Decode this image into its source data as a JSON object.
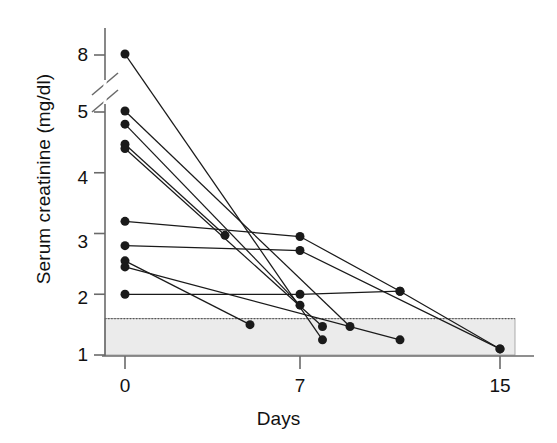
{
  "chart_data": {
    "type": "line",
    "title": "",
    "subtitle": "",
    "xlabel": "Days",
    "ylabel": "Serum creatinine (mg/dl)",
    "x_ticks": [
      0,
      7,
      15
    ],
    "x_tick_labels": [
      "0",
      "7",
      "15"
    ],
    "xlim": [
      -1,
      16
    ],
    "y_ticks": [
      1,
      2,
      3,
      4,
      5,
      8
    ],
    "y_tick_labels": [
      "1",
      "2",
      "3",
      "4",
      "5",
      "8"
    ],
    "ylim": [
      1,
      8
    ],
    "axis_break": {
      "present": true,
      "between": [
        5,
        8
      ],
      "description": "diagonal double-slash break on y-axis between 5 and 8"
    },
    "grid": false,
    "legend": null,
    "annotations": [],
    "shaded_band": {
      "label": "normal reference range",
      "y_min": 1.0,
      "y_max": 1.6,
      "fill": "#ebebeb",
      "top_border": "dotted",
      "extends_beyond_axis": true
    },
    "marker": {
      "shape": "circle",
      "color": "#1a1a1a",
      "size": 9
    },
    "line_color": "#1a1a1a",
    "series": [
      {
        "name": "Patient 1",
        "x": [
          0,
          7.9
        ],
        "y": [
          8.05,
          1.25
        ]
      },
      {
        "name": "Patient 2",
        "x": [
          0,
          9.0
        ],
        "y": [
          5.05,
          1.47
        ]
      },
      {
        "name": "Patient 3",
        "x": [
          0,
          7.0
        ],
        "y": [
          4.8,
          1.82
        ]
      },
      {
        "name": "Patient 4",
        "x": [
          0,
          4.0
        ],
        "y": [
          4.47,
          2.97
        ]
      },
      {
        "name": "Patient 5",
        "x": [
          0,
          7.9
        ],
        "y": [
          4.4,
          1.47
        ]
      },
      {
        "name": "Patient 6",
        "x": [
          0,
          7.0,
          11.0,
          15.0
        ],
        "y": [
          3.2,
          2.95,
          2.05,
          1.1
        ]
      },
      {
        "name": "Patient 7",
        "x": [
          0,
          7.0,
          15.0
        ],
        "y": [
          2.8,
          2.72,
          1.1
        ]
      },
      {
        "name": "Patient 8",
        "x": [
          0,
          5.0
        ],
        "y": [
          2.55,
          1.5
        ]
      },
      {
        "name": "Patient 9",
        "x": [
          0,
          11.0
        ],
        "y": [
          2.45,
          1.25
        ]
      },
      {
        "name": "Patient 10",
        "x": [
          0,
          7.0,
          11.0
        ],
        "y": [
          2.0,
          2.0,
          2.05
        ]
      }
    ]
  },
  "axis": {
    "y_title": "Serum creatinine (mg/dl)",
    "x_title": "Days",
    "y_tick_1": "1",
    "y_tick_2": "2",
    "y_tick_3": "3",
    "y_tick_4": "4",
    "y_tick_5": "5",
    "y_tick_8": "8",
    "x_tick_0": "0",
    "x_tick_7": "7",
    "x_tick_15": "15"
  },
  "colors": {
    "ink": "#1a1a1a",
    "axis": "#6a6a6a",
    "band_fill": "#ebebeb",
    "band_border": "#7a7a7a",
    "background": "#ffffff"
  }
}
